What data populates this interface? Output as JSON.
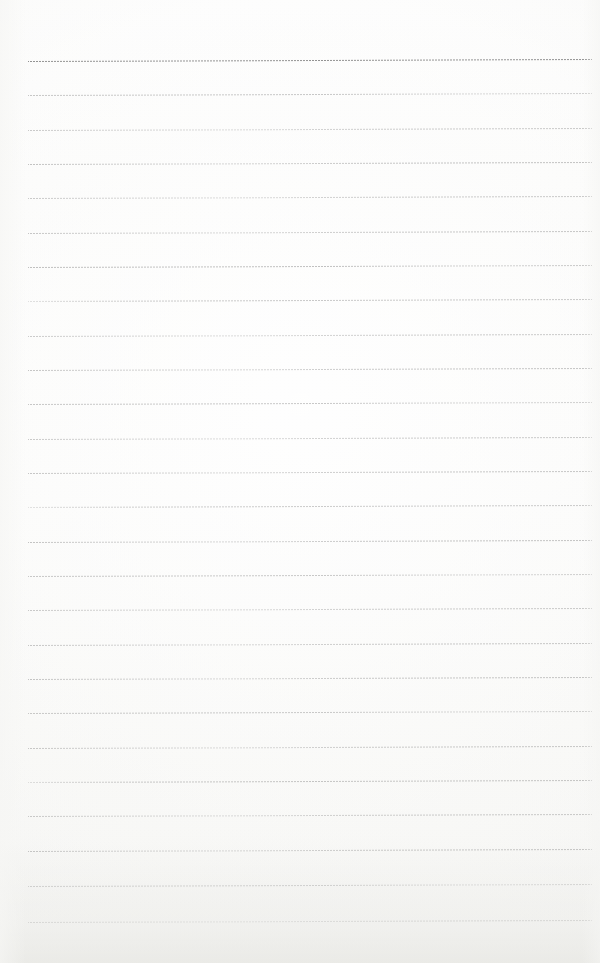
{
  "document": {
    "kind": "scanned-ruled-notebook-page",
    "title": "Blank ruled notebook page",
    "page_width": 600,
    "page_height": 963,
    "background_color": "#fdfdfc",
    "has_text_content": false,
    "has_handwriting": false,
    "margin_rule": false,
    "holes": 0
  },
  "ruling": {
    "line_color": "#8a8a8a",
    "first_line_y": 61,
    "last_line_y": 922,
    "line_spacing": 34.4,
    "line_count": 26,
    "line_left_x": 28,
    "line_right_x": 592,
    "line_thickness": 1,
    "tilt_degrees": -0.2,
    "lines": [
      {
        "index": 1,
        "y": 61,
        "opacity": 0.92,
        "fade": "none"
      },
      {
        "index": 2,
        "y": 95,
        "opacity": 0.46,
        "fade": "fade-right"
      },
      {
        "index": 3,
        "y": 130,
        "opacity": 0.44,
        "fade": "fade-mid"
      },
      {
        "index": 4,
        "y": 164,
        "opacity": 0.5,
        "fade": "fade-mid"
      },
      {
        "index": 5,
        "y": 198,
        "opacity": 0.44,
        "fade": "fade-mid"
      },
      {
        "index": 6,
        "y": 233,
        "opacity": 0.47,
        "fade": "fade-mid"
      },
      {
        "index": 7,
        "y": 267,
        "opacity": 0.52,
        "fade": "fade-right"
      },
      {
        "index": 8,
        "y": 301,
        "opacity": 0.45,
        "fade": "fade-left"
      },
      {
        "index": 9,
        "y": 336,
        "opacity": 0.43,
        "fade": "fade-mid"
      },
      {
        "index": 10,
        "y": 370,
        "opacity": 0.48,
        "fade": "fade-mid"
      },
      {
        "index": 11,
        "y": 404,
        "opacity": 0.46,
        "fade": "fade-right"
      },
      {
        "index": 12,
        "y": 439,
        "opacity": 0.44,
        "fade": "fade-mid"
      },
      {
        "index": 13,
        "y": 473,
        "opacity": 0.47,
        "fade": "fade-mid"
      },
      {
        "index": 14,
        "y": 507,
        "opacity": 0.43,
        "fade": "fade-left"
      },
      {
        "index": 15,
        "y": 542,
        "opacity": 0.49,
        "fade": "fade-mid"
      },
      {
        "index": 16,
        "y": 576,
        "opacity": 0.45,
        "fade": "fade-right"
      },
      {
        "index": 17,
        "y": 610,
        "opacity": 0.44,
        "fade": "fade-mid"
      },
      {
        "index": 18,
        "y": 645,
        "opacity": 0.46,
        "fade": "fade-mid"
      },
      {
        "index": 19,
        "y": 679,
        "opacity": 0.48,
        "fade": "fade-mid"
      },
      {
        "index": 20,
        "y": 713,
        "opacity": 0.44,
        "fade": "fade-right"
      },
      {
        "index": 21,
        "y": 748,
        "opacity": 0.45,
        "fade": "fade-mid"
      },
      {
        "index": 22,
        "y": 782,
        "opacity": 0.47,
        "fade": "fade-left"
      },
      {
        "index": 23,
        "y": 816,
        "opacity": 0.43,
        "fade": "fade-mid"
      },
      {
        "index": 24,
        "y": 851,
        "opacity": 0.48,
        "fade": "fade-mid"
      },
      {
        "index": 25,
        "y": 886,
        "opacity": 0.46,
        "fade": "fade-right"
      },
      {
        "index": 26,
        "y": 922,
        "opacity": 0.5,
        "fade": "fade-mid"
      }
    ]
  }
}
